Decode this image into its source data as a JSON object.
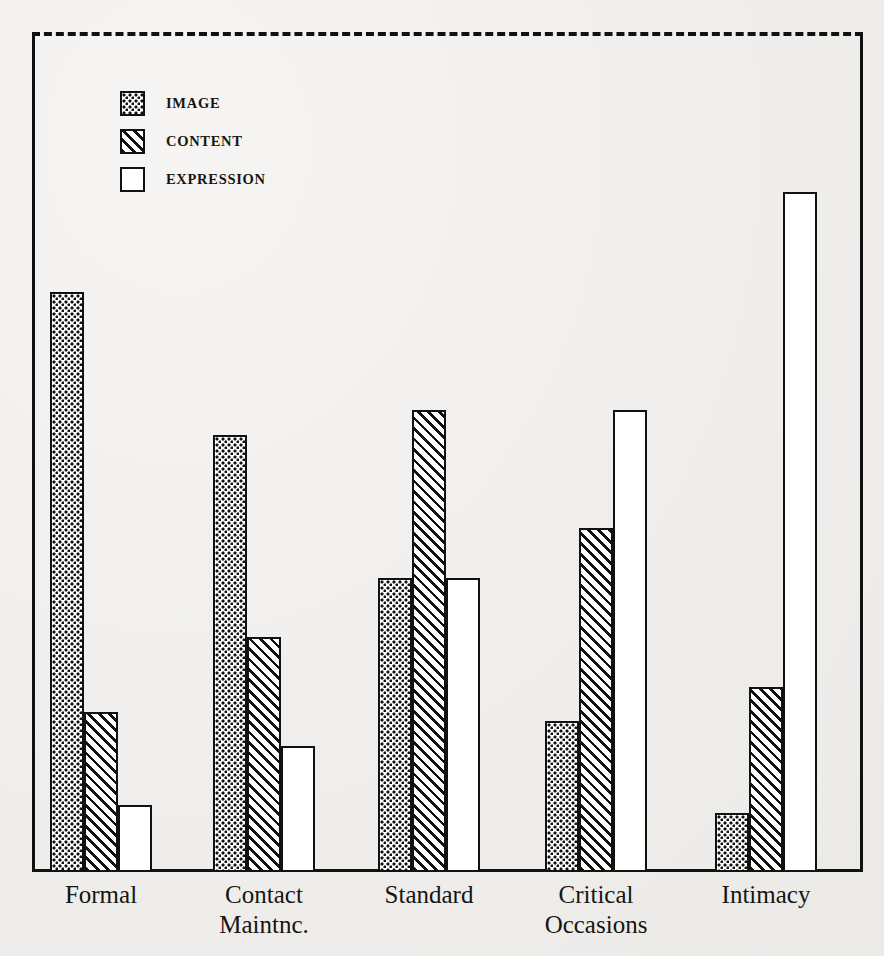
{
  "figure": {
    "scan_artifact_text": "",
    "frame": {
      "style": "solid-3-sides",
      "top_border_style": "dashed"
    }
  },
  "legend": {
    "position": "top-left-inside",
    "items": [
      {
        "label": "IMAGE",
        "pattern": "dotted",
        "swatch_icon": "dotted-swatch-icon"
      },
      {
        "label": "CONTENT",
        "pattern": "hatched",
        "swatch_icon": "hatched-swatch-icon"
      },
      {
        "label": "EXPRESSION",
        "pattern": "empty",
        "swatch_icon": "empty-swatch-icon"
      }
    ]
  },
  "chart_data": {
    "type": "bar",
    "title": "",
    "subtitle": "",
    "xlabel": "",
    "ylabel": "",
    "grid": false,
    "legend_position": "top-left",
    "axis_visible": {
      "left": true,
      "right": true,
      "bottom": true,
      "top": "dashed"
    },
    "ylim": [
      0,
      100
    ],
    "ytick_labels": [],
    "categories": [
      "Formal",
      "Contact\nMaintnc.",
      "Standard",
      "Critical\nOccasions",
      "Intimacy"
    ],
    "series": [
      {
        "name": "IMAGE",
        "pattern": "dotted",
        "values": [
          69,
          52,
          35,
          18,
          7
        ]
      },
      {
        "name": "CONTENT",
        "pattern": "hatched",
        "values": [
          19,
          28,
          55,
          41,
          22
        ]
      },
      {
        "name": "EXPRESSION",
        "pattern": "empty",
        "values": [
          8,
          15,
          35,
          55,
          81
        ]
      }
    ],
    "annotations": []
  },
  "colors": {
    "ink": "#111111",
    "paper": "#f2f1ef",
    "bar_fill": "#ffffff"
  }
}
